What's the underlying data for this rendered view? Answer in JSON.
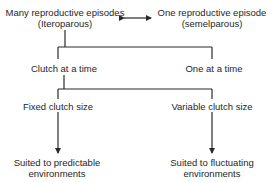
{
  "diagram": {
    "type": "flowchart",
    "nodes": {
      "iteroparous": {
        "line1": "Many reproductive episodes",
        "line2": "(Iteroparous)"
      },
      "semelparous": {
        "line1": "One reproductive episode",
        "line2": "(semelparous)"
      },
      "clutch_at_a_time": {
        "label": "Clutch at a time"
      },
      "one_at_a_time": {
        "label": "One at a time"
      },
      "fixed_clutch": {
        "label": "Fixed clutch size"
      },
      "variable_clutch": {
        "label": "Variable clutch size"
      },
      "predictable": {
        "line1": "Suited to predictable",
        "line2": "environments"
      },
      "fluctuating": {
        "line1": "Suited to fluctuating",
        "line2": "environments"
      }
    },
    "edges": [
      {
        "from": "iteroparous",
        "to": "semelparous",
        "style": "double-arrow"
      },
      {
        "from": "iteroparous",
        "to": [
          "clutch_at_a_time",
          "one_at_a_time"
        ],
        "style": "bracket"
      },
      {
        "from": "clutch_at_a_time",
        "to": [
          "fixed_clutch",
          "variable_clutch"
        ],
        "style": "bracket"
      },
      {
        "from": "fixed_clutch",
        "to": "predictable",
        "style": "arrow"
      },
      {
        "from": "variable_clutch",
        "to": "fluctuating",
        "style": "arrow"
      }
    ],
    "line_color": "#2a2a2a"
  }
}
